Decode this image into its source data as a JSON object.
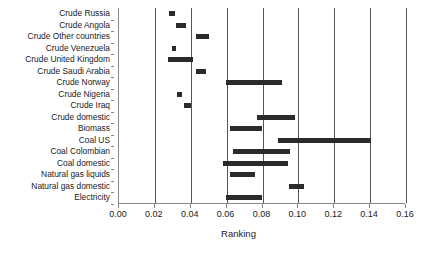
{
  "chart_data": {
    "type": "bar",
    "orientation": "horizontal",
    "title": "",
    "xlabel": "Ranking",
    "ylabel": "",
    "xlim": [
      0.0,
      0.16
    ],
    "ylim": [
      0,
      17
    ],
    "grid": true,
    "grid_axis": "x",
    "legend": null,
    "xticks": [
      0.0,
      0.02,
      0.04,
      0.06,
      0.08,
      0.1,
      0.12,
      0.14,
      0.16
    ],
    "xticklabels": [
      "0.00",
      "0.02",
      "0.04",
      "0.06",
      "0.08",
      "0.10",
      "0.12",
      "0.14",
      "0.16"
    ],
    "bar_color": "#2b2b2b",
    "categories": [
      "Crude Russia",
      "Crude Angola",
      "Crude Other countries",
      "Crude Venezuela",
      "Crude United Kingdom",
      "Crude Saudi Arabia",
      "Crude Norway",
      "Crude Nigeria",
      "Crude Iraq",
      "Crude domestic",
      "Biomass",
      "Coal US",
      "Coal Colombian",
      "Coal domestic",
      "Natural gas liquids",
      "Natural gas domestic",
      "Electricity"
    ],
    "ranges": [
      {
        "category": "Crude Russia",
        "low": 0.028,
        "high": 0.031
      },
      {
        "category": "Crude Angola",
        "low": 0.032,
        "high": 0.0375
      },
      {
        "category": "Crude Other countries",
        "low": 0.0432,
        "high": 0.05
      },
      {
        "category": "Crude Venezuela",
        "low": 0.0298,
        "high": 0.032
      },
      {
        "category": "Crude United Kingdom",
        "low": 0.0275,
        "high": 0.041
      },
      {
        "category": "Crude Saudi Arabia",
        "low": 0.0427,
        "high": 0.0483
      },
      {
        "category": "Crude Norway",
        "low": 0.0596,
        "high": 0.091
      },
      {
        "category": "Crude Nigeria",
        "low": 0.0326,
        "high": 0.0354
      },
      {
        "category": "Crude Iraq",
        "low": 0.0365,
        "high": 0.0404
      },
      {
        "category": "Crude domestic",
        "low": 0.0769,
        "high": 0.0983
      },
      {
        "category": "Biomass",
        "low": 0.0618,
        "high": 0.0798
      },
      {
        "category": "Coal US",
        "low": 0.0887,
        "high": 0.1404
      },
      {
        "category": "Coal Colombian",
        "low": 0.0635,
        "high": 0.0955
      },
      {
        "category": "Coal domestic",
        "low": 0.0579,
        "high": 0.0944
      },
      {
        "category": "Natural gas liquids",
        "low": 0.0618,
        "high": 0.0758
      },
      {
        "category": "Natural gas domestic",
        "low": 0.0949,
        "high": 0.1034
      },
      {
        "category": "Electricity",
        "low": 0.0596,
        "high": 0.0798
      }
    ]
  }
}
